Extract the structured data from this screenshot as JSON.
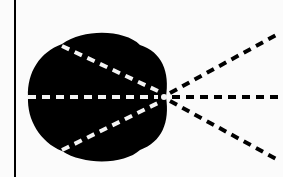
{
  "diagram": {
    "background": "#fbfbfb",
    "ink": "#000000",
    "gap": "#f4f4f4",
    "wall": {
      "x": 15,
      "y1": 0,
      "y2": 177,
      "width": 2
    },
    "focal_point": {
      "x": 164,
      "y": 97
    },
    "blob": {
      "path": "M 62 44 C 85 28, 125 30, 140 45 C 162 52, 170 72, 166 97 C 170 122, 162 142, 140 150 C 125 164, 85 166, 62 151 C 40 142, 27 120, 28 97 C 27 72, 40 52, 62 44 Z"
    },
    "inner_rays": [
      {
        "x1": 62,
        "y1": 46,
        "x2": 160,
        "y2": 92
      },
      {
        "x1": 28,
        "y1": 97,
        "x2": 158,
        "y2": 97
      },
      {
        "x1": 62,
        "y1": 150,
        "x2": 160,
        "y2": 102
      }
    ],
    "outer_rays": [
      {
        "x1": 170,
        "y1": 93,
        "x2": 278,
        "y2": 34
      },
      {
        "x1": 172,
        "y1": 97,
        "x2": 283,
        "y2": 97
      },
      {
        "x1": 170,
        "y1": 101,
        "x2": 278,
        "y2": 160
      }
    ]
  }
}
